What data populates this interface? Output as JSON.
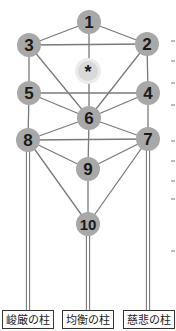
{
  "diagram": {
    "title": "",
    "colors": {
      "node_fill": "#a8a8a8",
      "hidden_node_fill": "#d9d9d9",
      "hidden_node_halo": "#ececec",
      "line": "#7a7a7a",
      "text": "#1a1a1a"
    },
    "nodes": [
      {
        "id": "1",
        "label": "1",
        "x": 89,
        "y": 22
      },
      {
        "id": "2",
        "label": "2",
        "x": 147,
        "y": 44
      },
      {
        "id": "3",
        "label": "3",
        "x": 29,
        "y": 45
      },
      {
        "id": "star",
        "label": "*",
        "x": 88,
        "y": 71,
        "hidden": true
      },
      {
        "id": "4",
        "label": "4",
        "x": 148,
        "y": 93
      },
      {
        "id": "5",
        "label": "5",
        "x": 29,
        "y": 93
      },
      {
        "id": "6",
        "label": "6",
        "x": 89,
        "y": 118
      },
      {
        "id": "7",
        "label": "7",
        "x": 148,
        "y": 139
      },
      {
        "id": "8",
        "label": "8",
        "x": 28,
        "y": 140
      },
      {
        "id": "9",
        "label": "9",
        "x": 88,
        "y": 169
      },
      {
        "id": "10",
        "label": "10",
        "x": 88,
        "y": 224
      }
    ],
    "edges": [
      [
        "1",
        "2"
      ],
      [
        "1",
        "3"
      ],
      [
        "1",
        "6"
      ],
      [
        "2",
        "3"
      ],
      [
        "2",
        "4"
      ],
      [
        "2",
        "6"
      ],
      [
        "3",
        "5"
      ],
      [
        "3",
        "6"
      ],
      [
        "4",
        "5"
      ],
      [
        "4",
        "6"
      ],
      [
        "4",
        "7"
      ],
      [
        "5",
        "6"
      ],
      [
        "5",
        "8"
      ],
      [
        "6",
        "7"
      ],
      [
        "6",
        "8"
      ],
      [
        "6",
        "9"
      ],
      [
        "7",
        "8"
      ],
      [
        "7",
        "9"
      ],
      [
        "7",
        "10"
      ],
      [
        "8",
        "9"
      ],
      [
        "8",
        "10"
      ],
      [
        "9",
        "10"
      ]
    ],
    "pillars": [
      {
        "name": "severity",
        "label": "峻厳の柱",
        "x": 28,
        "from_node": "8",
        "box_left": 2,
        "box_width": 52
      },
      {
        "name": "balance",
        "label": "均衡の柱",
        "x": 88,
        "from_node": "10",
        "box_left": 62,
        "box_width": 52
      },
      {
        "name": "mercy",
        "label": "慈悲の柱",
        "x": 148,
        "from_node": "7",
        "box_left": 123,
        "box_width": 52
      }
    ]
  }
}
